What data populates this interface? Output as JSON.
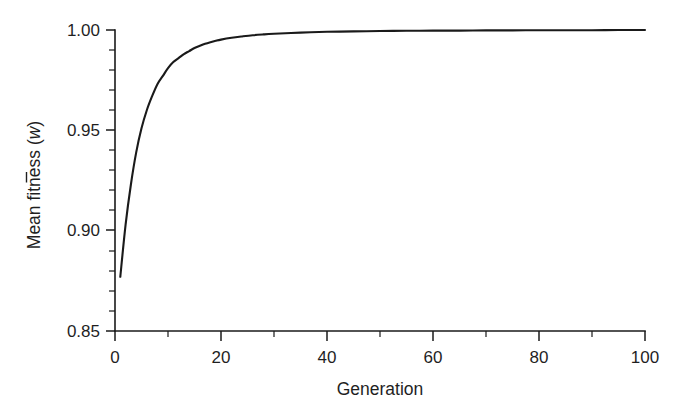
{
  "chart_data": {
    "type": "line",
    "title": "",
    "xlabel": "Generation",
    "ylabel": "Mean fitness (w̄)",
    "ylabel_prefix": "Mean fitness (",
    "ylabel_symbol": "w",
    "ylabel_suffix": ")",
    "xlim": [
      0,
      100
    ],
    "ylim": [
      0.85,
      1.0
    ],
    "grid": false,
    "legend": "none",
    "x_ticks": [
      0,
      20,
      40,
      60,
      80,
      100
    ],
    "x_tick_labels": [
      "0",
      "20",
      "40",
      "60",
      "80",
      "100"
    ],
    "x_minor_ticks": [
      10,
      30,
      50,
      70,
      90
    ],
    "y_ticks": [
      0.85,
      0.9,
      0.95,
      1.0
    ],
    "y_tick_labels": [
      "0.85",
      "0.90",
      "0.95",
      "1.00"
    ],
    "y_minor_ticks": [
      0.86,
      0.87,
      0.88,
      0.89,
      0.91,
      0.92,
      0.93,
      0.94,
      0.96,
      0.97,
      0.98,
      0.99
    ],
    "series": [
      {
        "name": "Mean fitness",
        "x": [
          1,
          2,
          3,
          4,
          5,
          6,
          7,
          8,
          9,
          10,
          11,
          12,
          13,
          14,
          15,
          16,
          17,
          18,
          19,
          20,
          22,
          24,
          26,
          28,
          30,
          35,
          40,
          45,
          50,
          55,
          60,
          65,
          70,
          75,
          80,
          85,
          90,
          95,
          100
        ],
        "y": [
          0.877,
          0.903,
          0.923,
          0.939,
          0.951,
          0.96,
          0.967,
          0.973,
          0.977,
          0.981,
          0.984,
          0.986,
          0.988,
          0.9895,
          0.991,
          0.9921,
          0.9931,
          0.9939,
          0.9946,
          0.9952,
          0.9961,
          0.9968,
          0.9974,
          0.9978,
          0.9981,
          0.9987,
          0.9991,
          0.9993,
          0.9995,
          0.9996,
          0.9997,
          0.9997,
          0.9998,
          0.9998,
          0.9999,
          0.9999,
          0.9999,
          1.0,
          1.0
        ]
      }
    ]
  },
  "style": {
    "line_color": "#1a1a1a",
    "axis_color": "#1a1a1a",
    "background": "#ffffff",
    "text_color": "#1f1f1f"
  }
}
